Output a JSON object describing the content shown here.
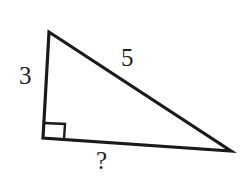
{
  "diagram": {
    "type": "right-triangle",
    "vertices": {
      "top": [
        49,
        32
      ],
      "right_angle": [
        43,
        138
      ],
      "right": [
        231,
        151
      ]
    },
    "right_angle_marker": {
      "x": 44,
      "y": 122,
      "size": 16
    },
    "labels": {
      "vertical_leg": "3",
      "hypotenuse": "5",
      "horizontal_leg": "?"
    },
    "colors": {
      "stroke": "#1a1a1a",
      "text": "#222222",
      "background": "#ffffff"
    }
  }
}
